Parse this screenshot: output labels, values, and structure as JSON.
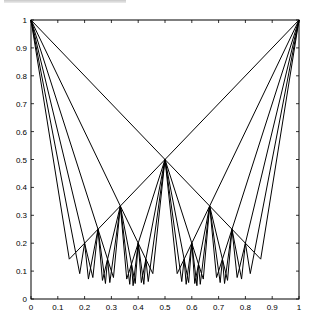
{
  "chart_data": {
    "type": "line",
    "title": "",
    "xlabel": "",
    "ylabel": "",
    "xlim": [
      0,
      1
    ],
    "ylim": [
      0,
      1
    ],
    "grid": false,
    "legend": null,
    "roots": [
      [
        0,
        1
      ],
      [
        1,
        1
      ]
    ],
    "depth": 6,
    "key_vertices": [
      {
        "x": 0,
        "y": 1
      },
      {
        "x": 1,
        "y": 1
      },
      {
        "x": 0.5,
        "y": 0.5
      },
      {
        "x": 0.3333,
        "y": 0.3333
      },
      {
        "x": 0.6667,
        "y": 0.3333
      },
      {
        "x": 0.25,
        "y": 0.25
      },
      {
        "x": 0.75,
        "y": 0.25
      },
      {
        "x": 0.2,
        "y": 0.2
      },
      {
        "x": 0.8,
        "y": 0.2
      },
      {
        "x": 0.1667,
        "y": 0.1667
      },
      {
        "x": 0.8333,
        "y": 0.1667
      },
      {
        "x": 0.1429,
        "y": 0.1429
      },
      {
        "x": 0.8571,
        "y": 0.1429
      }
    ],
    "xticks": [
      "0",
      "0.1",
      "0.2",
      "0.3",
      "0.4",
      "0.5",
      "0.6",
      "0.7",
      "0.8",
      "0.9",
      "1"
    ],
    "yticks": [
      "0",
      "0.1",
      "0.2",
      "0.3",
      "0.4",
      "0.5",
      "0.6",
      "0.7",
      "0.8",
      "0.9",
      "1"
    ],
    "line_color": "#000000"
  }
}
